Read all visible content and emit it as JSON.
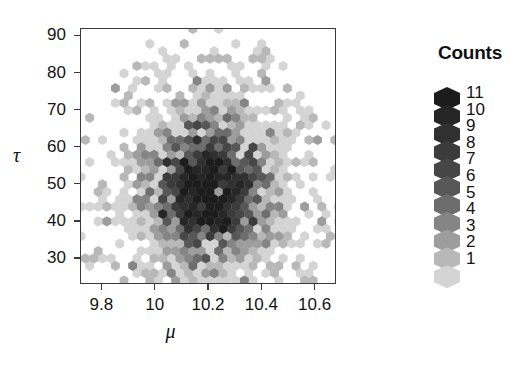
{
  "chart_data": {
    "type": "scatter",
    "subtype": "hexbin",
    "title": "",
    "xlabel": "μ",
    "ylabel": "τ",
    "xlim": [
      9.72,
      10.68
    ],
    "ylim": [
      23,
      92
    ],
    "grid": false,
    "x_ticks": [
      {
        "value": 9.8,
        "label": "9.8"
      },
      {
        "value": 10.0,
        "label": "10"
      },
      {
        "value": 10.2,
        "label": "10.2"
      },
      {
        "value": 10.4,
        "label": "10.4"
      },
      {
        "value": 10.6,
        "label": "10.6"
      }
    ],
    "y_ticks": [
      {
        "value": 90,
        "label": "90"
      },
      {
        "value": 80,
        "label": "80"
      },
      {
        "value": 70,
        "label": "70"
      },
      {
        "value": 60,
        "label": "60"
      },
      {
        "value": 50,
        "label": "50"
      },
      {
        "value": 40,
        "label": "40"
      },
      {
        "value": 30,
        "label": "30"
      }
    ],
    "legend": {
      "title": "Counts",
      "position": "right",
      "entries": [
        {
          "count": 11,
          "label": "11",
          "color": "#1c1c1c"
        },
        {
          "count": 10,
          "label": "10",
          "color": "#262626"
        },
        {
          "count": 9,
          "label": "9",
          "color": "#303030"
        },
        {
          "count": 8,
          "label": "8",
          "color": "#3b3b3b"
        },
        {
          "count": 7,
          "label": "7",
          "color": "#464646"
        },
        {
          "count": 6,
          "label": "6",
          "color": "#575757"
        },
        {
          "count": 5,
          "label": "5",
          "color": "#6d6d6d"
        },
        {
          "count": 4,
          "label": "4",
          "color": "#858585"
        },
        {
          "count": 3,
          "label": "3",
          "color": "#9d9d9d"
        },
        {
          "count": 2,
          "label": "2",
          "color": "#b8b8b8"
        },
        {
          "count": 1,
          "label": "1",
          "color": "#d4d4d4"
        }
      ]
    },
    "hex_geometry": {
      "radius_px": 5.1,
      "x_step_px": 8.6,
      "y_step_px": 7.4
    },
    "bins": [
      {
        "x": 10.2,
        "y": 48,
        "c": 11
      },
      {
        "x": 10.17,
        "y": 50,
        "c": 11
      },
      {
        "x": 10.22,
        "y": 51,
        "c": 11
      },
      {
        "x": 10.19,
        "y": 53,
        "c": 11
      },
      {
        "x": 10.23,
        "y": 47,
        "c": 11
      },
      {
        "x": 10.15,
        "y": 46,
        "c": 11
      },
      {
        "x": 10.26,
        "y": 49,
        "c": 11
      },
      {
        "x": 10.21,
        "y": 44,
        "c": 11
      },
      {
        "x": 10.18,
        "y": 41,
        "c": 11
      },
      {
        "x": 10.14,
        "y": 49,
        "c": 10
      },
      {
        "x": 10.25,
        "y": 52,
        "c": 10
      },
      {
        "x": 10.28,
        "y": 46,
        "c": 10
      },
      {
        "x": 10.12,
        "y": 52,
        "c": 10
      },
      {
        "x": 10.24,
        "y": 42,
        "c": 10
      },
      {
        "x": 10.16,
        "y": 43,
        "c": 10
      },
      {
        "x": 10.2,
        "y": 55,
        "c": 10
      },
      {
        "x": 10.1,
        "y": 47,
        "c": 10
      },
      {
        "x": 10.27,
        "y": 44,
        "c": 9
      },
      {
        "x": 10.11,
        "y": 44,
        "c": 9
      },
      {
        "x": 10.22,
        "y": 39,
        "c": 9
      },
      {
        "x": 10.3,
        "y": 50,
        "c": 9
      },
      {
        "x": 10.08,
        "y": 50,
        "c": 9
      },
      {
        "x": 10.17,
        "y": 57,
        "c": 9
      },
      {
        "x": 10.26,
        "y": 56,
        "c": 9
      },
      {
        "x": 10.13,
        "y": 39,
        "c": 9
      },
      {
        "x": 10.06,
        "y": 53,
        "c": 8
      },
      {
        "x": 10.31,
        "y": 45,
        "c": 8
      },
      {
        "x": 10.19,
        "y": 37,
        "c": 8
      },
      {
        "x": 10.24,
        "y": 58,
        "c": 8
      },
      {
        "x": 10.09,
        "y": 42,
        "c": 8
      },
      {
        "x": 10.33,
        "y": 48,
        "c": 8
      },
      {
        "x": 10.14,
        "y": 59,
        "c": 8
      },
      {
        "x": 10.29,
        "y": 40,
        "c": 8
      },
      {
        "x": 10.04,
        "y": 47,
        "c": 7
      },
      {
        "x": 10.35,
        "y": 52,
        "c": 7
      },
      {
        "x": 10.16,
        "y": 34,
        "c": 7
      },
      {
        "x": 10.27,
        "y": 61,
        "c": 7
      },
      {
        "x": 10.07,
        "y": 57,
        "c": 7
      },
      {
        "x": 10.32,
        "y": 42,
        "c": 7
      },
      {
        "x": 10.11,
        "y": 36,
        "c": 7
      },
      {
        "x": 10.21,
        "y": 62,
        "c": 7
      },
      {
        "x": 10.02,
        "y": 51,
        "c": 6
      },
      {
        "x": 10.37,
        "y": 46,
        "c": 6
      },
      {
        "x": 10.24,
        "y": 35,
        "c": 6
      },
      {
        "x": 10.13,
        "y": 63,
        "c": 6
      },
      {
        "x": 10.34,
        "y": 57,
        "c": 6
      },
      {
        "x": 10.05,
        "y": 41,
        "c": 6
      },
      {
        "x": 10.18,
        "y": 66,
        "c": 6
      },
      {
        "x": 10.3,
        "y": 36,
        "c": 6
      },
      {
        "x": 9.99,
        "y": 48,
        "c": 5
      },
      {
        "x": 10.4,
        "y": 50,
        "c": 5
      },
      {
        "x": 10.28,
        "y": 65,
        "c": 5
      },
      {
        "x": 10.08,
        "y": 62,
        "c": 5
      },
      {
        "x": 10.36,
        "y": 39,
        "c": 5
      },
      {
        "x": 10.01,
        "y": 56,
        "c": 5
      },
      {
        "x": 10.15,
        "y": 31,
        "c": 5
      },
      {
        "x": 10.26,
        "y": 68,
        "c": 5
      },
      {
        "x": 9.96,
        "y": 45,
        "c": 4
      },
      {
        "x": 10.42,
        "y": 44,
        "c": 4
      },
      {
        "x": 10.33,
        "y": 63,
        "c": 4
      },
      {
        "x": 10.04,
        "y": 65,
        "c": 4
      },
      {
        "x": 10.39,
        "y": 56,
        "c": 4
      },
      {
        "x": 9.97,
        "y": 53,
        "c": 4
      },
      {
        "x": 10.22,
        "y": 70,
        "c": 4
      },
      {
        "x": 10.31,
        "y": 33,
        "c": 4
      },
      {
        "x": 9.93,
        "y": 50,
        "c": 3
      },
      {
        "x": 10.45,
        "y": 48,
        "c": 3
      },
      {
        "x": 10.12,
        "y": 69,
        "c": 3
      },
      {
        "x": 10.41,
        "y": 61,
        "c": 3
      },
      {
        "x": 9.94,
        "y": 58,
        "c": 3
      },
      {
        "x": 10.37,
        "y": 34,
        "c": 3
      },
      {
        "x": 10.17,
        "y": 73,
        "c": 3
      },
      {
        "x": 10.07,
        "y": 33,
        "c": 3
      },
      {
        "x": 9.9,
        "y": 54,
        "c": 2
      },
      {
        "x": 10.48,
        "y": 52,
        "c": 2
      },
      {
        "x": 10.29,
        "y": 72,
        "c": 2
      },
      {
        "x": 10.44,
        "y": 40,
        "c": 2
      },
      {
        "x": 9.91,
        "y": 44,
        "c": 2
      },
      {
        "x": 10.09,
        "y": 75,
        "c": 2
      },
      {
        "x": 10.35,
        "y": 68,
        "c": 2
      },
      {
        "x": 10.24,
        "y": 29,
        "c": 2
      },
      {
        "x": 9.87,
        "y": 49,
        "c": 1
      },
      {
        "x": 10.52,
        "y": 46,
        "c": 1
      },
      {
        "x": 10.2,
        "y": 79,
        "c": 1
      },
      {
        "x": 10.47,
        "y": 58,
        "c": 1
      },
      {
        "x": 9.85,
        "y": 57,
        "c": 1
      },
      {
        "x": 10.14,
        "y": 80,
        "c": 1
      },
      {
        "x": 10.4,
        "y": 66,
        "c": 1
      },
      {
        "x": 10.56,
        "y": 43,
        "c": 1
      },
      {
        "x": 9.89,
        "y": 38,
        "c": 1
      },
      {
        "x": 10.27,
        "y": 82,
        "c": 1
      },
      {
        "x": 10.1,
        "y": 27,
        "c": 1
      },
      {
        "x": 10.59,
        "y": 49,
        "c": 1
      },
      {
        "x": 10.23,
        "y": 87,
        "c": 1
      },
      {
        "x": 10.5,
        "y": 34,
        "c": 1
      },
      {
        "x": 9.95,
        "y": 28,
        "c": 1
      },
      {
        "x": 10.62,
        "y": 38,
        "c": 1
      }
    ]
  }
}
